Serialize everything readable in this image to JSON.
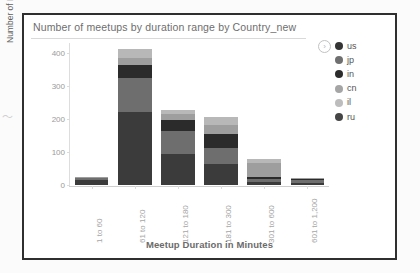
{
  "chart_data": {
    "type": "bar",
    "stacked": true,
    "title": "Number of meetups by duration range by Country_new",
    "xlabel": "Meetup Duration in Minutes",
    "ylabel": "Number of Meetups",
    "categories": [
      "1 to 60",
      "61 to 120",
      "121 to 180",
      "181 to 300",
      "301 to 600",
      "601 to 1,200"
    ],
    "ylim": [
      0,
      430
    ],
    "yticks": [
      0,
      100,
      200,
      300,
      400
    ],
    "ytick_labels": [
      "0",
      "100",
      "200",
      "300",
      "400"
    ],
    "grid": false,
    "legend_position": "right",
    "series": [
      {
        "name": "us",
        "color": "#3b3b3b",
        "values": [
          14,
          221,
          93,
          63,
          9,
          5
        ]
      },
      {
        "name": "jp",
        "color": "#6e6e6e",
        "values": [
          6,
          104,
          71,
          50,
          8,
          9
        ]
      },
      {
        "name": "in",
        "color": "#2b2b2b",
        "values": [
          2,
          38,
          33,
          42,
          6,
          4
        ]
      },
      {
        "name": "cn",
        "color": "#9e9e9e",
        "values": [
          1,
          22,
          17,
          27,
          45,
          2
        ]
      },
      {
        "name": "il",
        "color": "#b8b8b8",
        "values": [
          0,
          27,
          12,
          24,
          11,
          1
        ]
      },
      {
        "name": "ru",
        "color": "#4a4a4a",
        "values": [
          0,
          0,
          0,
          0,
          0,
          0
        ]
      }
    ],
    "totals": [
      23,
      412,
      226,
      206,
      79,
      21
    ]
  },
  "legend": {
    "expand_icon": "›",
    "items": [
      {
        "label": "us",
        "color": "#343434"
      },
      {
        "label": "jp",
        "color": "#6f6f6f"
      },
      {
        "label": "in",
        "color": "#2c2c2c"
      },
      {
        "label": "cn",
        "color": "#a5a5a5"
      },
      {
        "label": "il",
        "color": "#bdbdbd"
      },
      {
        "label": "ru",
        "color": "#454545"
      }
    ]
  }
}
